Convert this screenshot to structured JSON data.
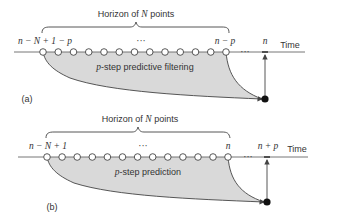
{
  "panels": [
    {
      "id": "a",
      "caption": "(a)",
      "horizon_prefix": "Horizon of ",
      "horizon_var": "N",
      "horizon_suffix": " points",
      "start_label": "n − N + 1 − p",
      "end_label": "n − p",
      "ellipsis_mid": "···",
      "ellipsis_right": "···",
      "target_label": "n",
      "region_label_var": "p",
      "region_label_text": "-step predictive filtering",
      "time_label": "Time"
    },
    {
      "id": "b",
      "caption": "(b)",
      "horizon_prefix": "Horizon of ",
      "horizon_var": "N",
      "horizon_suffix": " points",
      "start_label": "n − N + 1",
      "end_label": "n",
      "ellipsis_mid": "···",
      "ellipsis_right": "···",
      "target_label": "n + p",
      "region_label_var": "p",
      "region_label_text": "-step prediction",
      "time_label": "Time"
    }
  ],
  "colors": {
    "line": "#555555",
    "fill": "#d9d9d9",
    "text": "#333333"
  }
}
